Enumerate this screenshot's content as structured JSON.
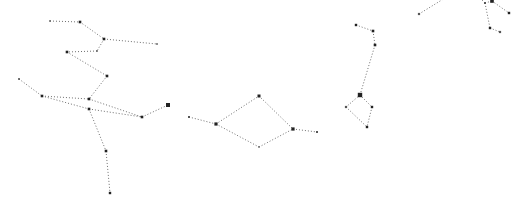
{
  "canvas": {
    "width": 519,
    "height": 201,
    "background": "#ffffff"
  },
  "style": {
    "edge_color": "#6f6f6f",
    "star_color": "#222222",
    "point_color": "#555555"
  },
  "constellations": [
    {
      "id": "left-figure",
      "stars": [
        {
          "x": 50,
          "y": 21,
          "r": 0.8
        },
        {
          "x": 80,
          "y": 22,
          "r": 1.3
        },
        {
          "x": 104,
          "y": 39,
          "r": 1.3
        },
        {
          "x": 157,
          "y": 44,
          "r": 0.8
        },
        {
          "x": 97,
          "y": 51,
          "r": 0.8
        },
        {
          "x": 67,
          "y": 52,
          "r": 1.3
        },
        {
          "x": 107,
          "y": 76,
          "r": 1.3
        },
        {
          "x": 89,
          "y": 99,
          "r": 1.3
        },
        {
          "x": 19,
          "y": 79,
          "r": 0.9
        },
        {
          "x": 42,
          "y": 96,
          "r": 1.3
        },
        {
          "x": 89,
          "y": 109,
          "r": 1.3
        },
        {
          "x": 142,
          "y": 117,
          "r": 1.3
        },
        {
          "x": 168,
          "y": 105,
          "r": 2.0
        },
        {
          "x": 106,
          "y": 151,
          "r": 1.3
        },
        {
          "x": 110,
          "y": 193,
          "r": 1.2
        }
      ],
      "edges": [
        [
          0,
          1
        ],
        [
          1,
          2
        ],
        [
          2,
          3
        ],
        [
          2,
          4
        ],
        [
          4,
          5
        ],
        [
          5,
          6
        ],
        [
          6,
          7
        ],
        [
          8,
          9
        ],
        [
          9,
          7
        ],
        [
          7,
          11
        ],
        [
          9,
          10
        ],
        [
          10,
          11
        ],
        [
          11,
          12
        ],
        [
          10,
          13
        ],
        [
          13,
          14
        ]
      ]
    },
    {
      "id": "middle-diamond",
      "stars": [
        {
          "x": 189,
          "y": 117,
          "r": 1.0
        },
        {
          "x": 216,
          "y": 124,
          "r": 1.6
        },
        {
          "x": 259,
          "y": 96,
          "r": 1.5
        },
        {
          "x": 293,
          "y": 129,
          "r": 1.6
        },
        {
          "x": 317,
          "y": 132,
          "r": 1.0
        },
        {
          "x": 259,
          "y": 147,
          "r": 0.7
        }
      ],
      "edges": [
        [
          0,
          1
        ],
        [
          1,
          2
        ],
        [
          2,
          3
        ],
        [
          3,
          4
        ],
        [
          1,
          5
        ],
        [
          5,
          3
        ]
      ]
    },
    {
      "id": "right-figure",
      "stars": [
        {
          "x": 356,
          "y": 25,
          "r": 1.2
        },
        {
          "x": 373,
          "y": 31,
          "r": 1.3
        },
        {
          "x": 375,
          "y": 45,
          "r": 1.3
        },
        {
          "x": 360,
          "y": 95,
          "r": 2.2
        },
        {
          "x": 346,
          "y": 107,
          "r": 1.1
        },
        {
          "x": 372,
          "y": 107,
          "r": 1.2
        },
        {
          "x": 367,
          "y": 127,
          "r": 1.2
        }
      ],
      "edges": [
        [
          0,
          1
        ],
        [
          1,
          2
        ],
        [
          2,
          3
        ],
        [
          3,
          4
        ],
        [
          3,
          5
        ],
        [
          4,
          6
        ],
        [
          5,
          6
        ]
      ]
    },
    {
      "id": "top-right-figure",
      "stars": [
        {
          "x": 419,
          "y": 14,
          "r": 1.1
        },
        {
          "x": 445,
          "y": -2,
          "r": 0.1
        },
        {
          "x": 480,
          "y": -2,
          "r": 0.1
        },
        {
          "x": 485,
          "y": 3,
          "r": 1.0
        },
        {
          "x": 492,
          "y": 1,
          "r": 1.8
        },
        {
          "x": 509,
          "y": 13,
          "r": 1.2
        },
        {
          "x": 490,
          "y": 28,
          "r": 1.2
        },
        {
          "x": 500,
          "y": 32,
          "r": 1.1
        }
      ],
      "edges": [
        [
          0,
          1
        ],
        [
          2,
          3
        ],
        [
          3,
          4
        ],
        [
          4,
          5
        ],
        [
          3,
          6
        ],
        [
          6,
          7
        ]
      ]
    }
  ]
}
